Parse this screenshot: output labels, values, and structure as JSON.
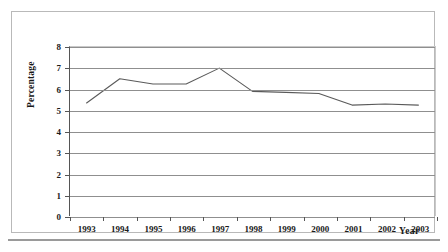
{
  "chart_data": {
    "type": "line",
    "title": "",
    "xlabel": "Year",
    "ylabel": "Percentage",
    "categories": [
      "1993",
      "1994",
      "1995",
      "1996",
      "1997",
      "1998",
      "1999",
      "2000",
      "2001",
      "2002",
      "2003"
    ],
    "values": [
      5.35,
      6.5,
      6.25,
      6.25,
      7.0,
      5.9,
      5.85,
      5.8,
      5.25,
      5.3,
      5.25
    ],
    "ylim": [
      0,
      8
    ],
    "yticks": [
      "0",
      "1",
      "2",
      "3",
      "4",
      "5",
      "6",
      "7",
      "8"
    ],
    "ytick_values": [
      0,
      1,
      2,
      3,
      4,
      5,
      6,
      7,
      8
    ],
    "grid": true,
    "legend": "none",
    "series_color": "#5a5a5a",
    "gridline_color": "#8f8f8f",
    "axis_color": "#555555",
    "text_color": "#1a1a1a"
  }
}
